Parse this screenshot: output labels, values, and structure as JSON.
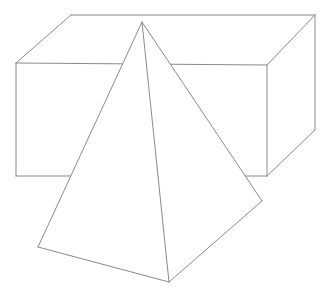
{
  "scene": {
    "title": "Line drawing of a rectangular box with a pyramid in front",
    "width": 332,
    "height": 296,
    "background_color": "#ffffff",
    "line_color": "#8a8a8a",
    "line_width": 1
  },
  "shapes": {
    "box": {
      "name": "rectangular-box",
      "label": "Rectangular box (cuboid)",
      "vertices": {
        "top_back_left": [
          71,
          15
        ],
        "top_back_right": [
          315,
          15
        ],
        "top_front_right": [
          267,
          65
        ],
        "top_front_left": [
          16,
          63
        ],
        "bottom_front_left": [
          16,
          176
        ],
        "bottom_front_right": [
          267,
          176
        ],
        "bottom_back_right": [
          315,
          130
        ]
      },
      "faces": {
        "top": "71,15 315,15 267,65 16,63",
        "front": "16,63 267,65 267,176 16,176",
        "right": "267,65 315,15 315,130 267,176"
      },
      "edges": {
        "top_back": "M71,15 L315,15",
        "top_left_diagonal": "M71,15 L16,63",
        "top_front": "M16,63 L267,65",
        "top_right_diagonal": "M267,65 L315,15",
        "left_vertical": "M16,63 L16,176",
        "front_right_vertical": "M267,65 L267,176",
        "back_right_vertical": "M315,15 L315,130",
        "bottom_front": "M16,176 L267,176",
        "bottom_right_diagonal": "M267,176 L315,130"
      }
    },
    "pyramid": {
      "name": "square-pyramid",
      "label": "Pyramid",
      "vertices": {
        "apex": [
          142,
          22
        ],
        "base_left": [
          38,
          247
        ],
        "base_front": [
          169,
          282
        ],
        "base_right": [
          262,
          201
        ]
      },
      "faces": {
        "left": "142,22 38,247 169,282",
        "right": "142,22 169,282 262,201"
      },
      "edges": {
        "apex_to_base_left": "M142,22 L38,247",
        "apex_to_base_front": "M142,22 L169,282",
        "apex_to_base_right": "M142,22 L262,201",
        "base_left_to_front": "M38,247 L169,282",
        "base_front_to_right": "M169,282 L262,201"
      }
    }
  }
}
